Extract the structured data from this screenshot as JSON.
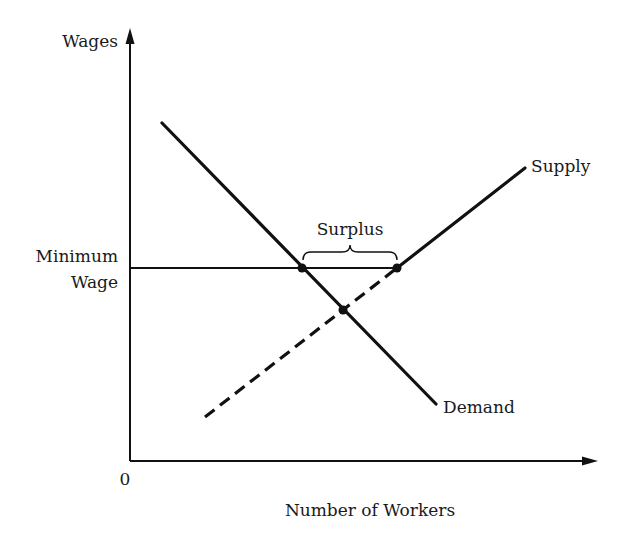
{
  "axes": {
    "y_label": "Wages",
    "x_label": "Number of Workers",
    "origin_label": "0"
  },
  "labels": {
    "minimum_wage_line1": "Minimum",
    "minimum_wage_line2": "Wage",
    "surplus": "Surplus",
    "supply": "Supply",
    "demand": "Demand"
  },
  "curves": {
    "demand": {
      "start": [
        162,
        123
      ],
      "end": [
        436,
        404
      ],
      "style": "solid"
    },
    "supply_below_min_wage": {
      "start": [
        205,
        417
      ],
      "end": [
        397,
        268
      ],
      "style": "dashed"
    },
    "supply_above_min_wage": {
      "start": [
        397,
        268
      ],
      "end": [
        525,
        168
      ],
      "style": "solid"
    },
    "minimum_wage": {
      "start": [
        130,
        268
      ],
      "end": [
        397,
        268
      ],
      "style": "solid"
    }
  },
  "points": {
    "demand_at_min_wage": [
      302,
      268
    ],
    "supply_at_min_wage": [
      397,
      268
    ],
    "equilibrium": [
      343,
      310
    ]
  },
  "colors": {
    "ink": "#111111",
    "background": "#ffffff"
  }
}
